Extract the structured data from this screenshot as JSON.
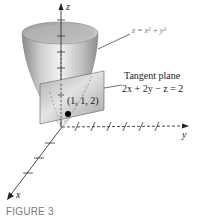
{
  "figure": {
    "caption": "FIGURE 3",
    "axes": {
      "x_label": "x",
      "y_label": "y",
      "z_label": "z"
    },
    "surface": {
      "equation": "z = x² + y²",
      "type": "paraboloid"
    },
    "tangent_plane": {
      "title": "Tangent plane",
      "equation": "2x + 2y − z = 2"
    },
    "point": {
      "label": "(1, 1, 2)"
    },
    "colors": {
      "axis": "#333333",
      "surface_light": "#e6e6e6",
      "surface_dark": "#8c8c8c",
      "plane": "#c8c8c8",
      "point": "#000000",
      "caption": "#7a7a7a"
    }
  }
}
